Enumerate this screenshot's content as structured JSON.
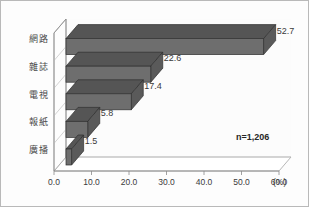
{
  "chart_data": {
    "type": "bar",
    "orientation": "horizontal",
    "style": "3d",
    "title": "",
    "subtitle": "",
    "xlabel": "(%)",
    "ylabel": "",
    "categories": [
      "網路",
      "雜誌",
      "電視",
      "報紙",
      "廣播"
    ],
    "values": [
      52.7,
      22.6,
      17.4,
      5.8,
      1.5
    ],
    "value_labels": [
      "52.7",
      "22.6",
      "17.4",
      "5.8",
      "1.5"
    ],
    "xlim": [
      0.0,
      60.0
    ],
    "xticks": [
      0.0,
      10.0,
      20.0,
      30.0,
      40.0,
      50.0,
      60.0
    ],
    "xtick_labels": [
      "0.0",
      "10.0",
      "20.0",
      "30.0",
      "40.0",
      "50.0",
      "60.0"
    ],
    "grid": false,
    "legend": null,
    "annotations": [
      "n=1,206"
    ],
    "series": [
      {
        "name": "",
        "values": [
          52.7,
          22.6,
          17.4,
          5.8,
          1.5
        ]
      }
    ],
    "colors": {
      "bar_face": "#6e6e6e",
      "bar_top": "#555555",
      "bar_side": "#5a5a5a",
      "bar_outline": "#2f2f2f",
      "axis": "#8a8a8a",
      "wall": "#fbfbfb",
      "text": "#3a3a3a",
      "frame": "#b9b9b9",
      "background": "#fdfdfd"
    }
  },
  "axis": {
    "unit": "(%)"
  },
  "note": {
    "sample_size": "n=1,206"
  }
}
